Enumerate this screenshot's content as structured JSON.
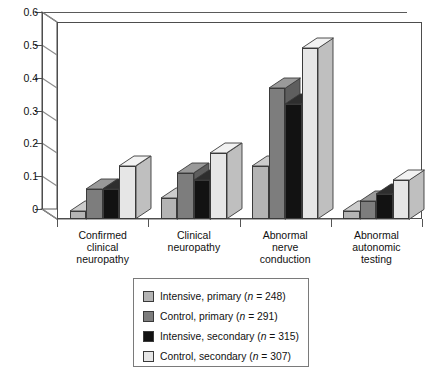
{
  "chart_data": {
    "type": "bar",
    "title": "",
    "subtitle": "",
    "xlabel": "",
    "ylabel": "",
    "ylim": [
      0,
      0.6
    ],
    "grid": true,
    "legend_position": "bottom",
    "style": "3d-clustered-bar",
    "categories": [
      "Confirmed clinical neuropathy",
      "Clinical neuropathy",
      "Abnormal nerve conduction",
      "Abnormal autonomic testing"
    ],
    "category_lines": [
      [
        "Confirmed",
        "clinical",
        "neuropathy"
      ],
      [
        "Clinical",
        "neuropathy"
      ],
      [
        "Abnormal",
        "nerve",
        "conduction"
      ],
      [
        "Abnormal",
        "autonomic",
        "testing"
      ]
    ],
    "y_ticks": [
      "0",
      "0.1",
      "0.2",
      "0.3",
      "0.4",
      "0.5",
      "0.6"
    ],
    "y_tick_values": [
      0,
      0.1,
      0.2,
      0.3,
      0.4,
      0.5,
      0.6
    ],
    "series": [
      {
        "name": "Intensive, primary",
        "n": 248,
        "legend_label": "Intensive, primary (n = 248)",
        "color": "#b4b4b4",
        "top_color": "#cccccc",
        "side_color": "#8f8f8f",
        "values": [
          0.025,
          0.065,
          0.16,
          0.025
        ]
      },
      {
        "name": "Control, primary",
        "n": 291,
        "legend_label": "Control, primary (n = 291)",
        "color": "#7d7d7d",
        "top_color": "#9a9a9a",
        "side_color": "#5e5e5e",
        "values": [
          0.09,
          0.14,
          0.4,
          0.055
        ]
      },
      {
        "name": "Intensive, secondary",
        "n": 315,
        "legend_label": "Intensive, secondary (n = 315)",
        "color": "#121212",
        "top_color": "#2e2e2e",
        "side_color": "#000000",
        "values": [
          0.09,
          0.12,
          0.35,
          0.075
        ]
      },
      {
        "name": "Control, secondary",
        "n": 307,
        "legend_label": "Control, secondary (n = 307)",
        "color": "#e6e6e6",
        "top_color": "#f2f2f2",
        "side_color": "#bfbfbf",
        "values": [
          0.16,
          0.2,
          0.52,
          0.12
        ]
      }
    ]
  },
  "legend": {
    "entries": [
      {
        "label_prefix": "Intensive, primary (",
        "n_label": "n",
        "equals": " = ",
        "n_value": "248",
        "label_suffix": ")"
      },
      {
        "label_prefix": "Control, primary (",
        "n_label": "n",
        "equals": " = ",
        "n_value": "291",
        "label_suffix": ")"
      },
      {
        "label_prefix": "Intensive, secondary (",
        "n_label": "n",
        "equals": " = ",
        "n_value": "315",
        "label_suffix": ")"
      },
      {
        "label_prefix": "Control, secondary (",
        "n_label": "n",
        "equals": " = ",
        "n_value": "307",
        "label_suffix": ")"
      }
    ]
  },
  "colors": {
    "background": "#ffffff",
    "axis": "#4d4d4d",
    "gridline": "#777777",
    "text": "#111111",
    "legend_border": "#7a7a7a"
  }
}
